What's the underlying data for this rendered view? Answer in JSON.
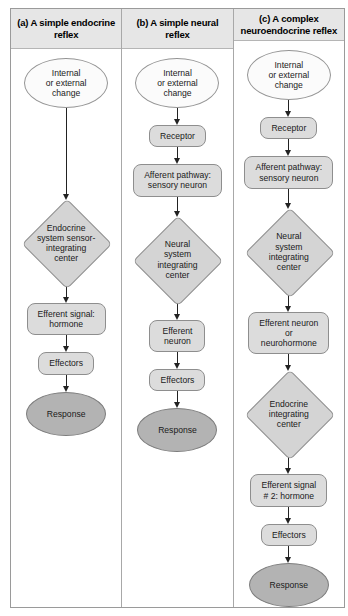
{
  "figure": {
    "background": "#ffffff",
    "border_color": "#9a9a9a",
    "header_background": "#e6e6e6",
    "node_fill": "#dcdcdc",
    "diamond_fill": "#d4d4d4",
    "response_fill": "#b3b3b3",
    "start_fill": "#fbfbfb",
    "arrow_color": "#222222"
  },
  "columns": [
    {
      "id": "a",
      "header": "(a) A simple endocrine reflex",
      "nodes": [
        {
          "shape": "ellipse",
          "name": "stimulus",
          "label": "Internal\nor external\nchange"
        },
        {
          "shape": "arrow",
          "name": "arrow-long",
          "length": "long"
        },
        {
          "shape": "diamond",
          "name": "integrating-center",
          "label": "Endocrine\nsystem sensor-\nintegrating\ncenter"
        },
        {
          "shape": "arrow",
          "name": "arrow",
          "length": "short"
        },
        {
          "shape": "rrect",
          "name": "efferent-signal",
          "label": "Efferent signal:\nhormone"
        },
        {
          "shape": "arrow",
          "name": "arrow",
          "length": "short"
        },
        {
          "shape": "rrect",
          "name": "effectors",
          "label": "Effectors"
        },
        {
          "shape": "arrow",
          "name": "arrow",
          "length": "short"
        },
        {
          "shape": "ellipse-dark",
          "name": "response",
          "label": "Response"
        }
      ]
    },
    {
      "id": "b",
      "header": "(b) A simple neural reflex",
      "nodes": [
        {
          "shape": "ellipse",
          "name": "stimulus",
          "label": "Internal\nor external\nchange"
        },
        {
          "shape": "arrow",
          "name": "arrow",
          "length": "short"
        },
        {
          "shape": "rrect",
          "name": "receptor",
          "label": "Receptor"
        },
        {
          "shape": "arrow",
          "name": "arrow",
          "length": "short"
        },
        {
          "shape": "rrect",
          "name": "afferent-pathway",
          "label": "Afferent pathway:\nsensory neuron"
        },
        {
          "shape": "arrow",
          "name": "arrow",
          "length": "mid"
        },
        {
          "shape": "diamond",
          "name": "integrating-center",
          "label": "Neural\nsystem\nintegrating\ncenter"
        },
        {
          "shape": "arrow",
          "name": "arrow",
          "length": "short"
        },
        {
          "shape": "rrect",
          "name": "efferent-neuron",
          "label": "Efferent\nneuron"
        },
        {
          "shape": "arrow",
          "name": "arrow",
          "length": "short"
        },
        {
          "shape": "rrect",
          "name": "effectors",
          "label": "Effectors"
        },
        {
          "shape": "arrow",
          "name": "arrow",
          "length": "short"
        },
        {
          "shape": "ellipse-dark",
          "name": "response",
          "label": "Response"
        }
      ]
    },
    {
      "id": "c",
      "header": "(c) A complex neuroendocrine reflex",
      "nodes": [
        {
          "shape": "ellipse",
          "name": "stimulus",
          "label": "Internal\nor external\nchange"
        },
        {
          "shape": "arrow",
          "name": "arrow",
          "length": "short"
        },
        {
          "shape": "rrect",
          "name": "receptor",
          "label": "Receptor"
        },
        {
          "shape": "arrow",
          "name": "arrow",
          "length": "short"
        },
        {
          "shape": "rrect",
          "name": "afferent-pathway",
          "label": "Afferent pathway:\nsensory neuron"
        },
        {
          "shape": "arrow",
          "name": "arrow",
          "length": "mid"
        },
        {
          "shape": "diamond",
          "name": "neural-integrating-center",
          "label": "Neural\nsystem\nintegrating\ncenter"
        },
        {
          "shape": "arrow",
          "name": "arrow",
          "length": "short"
        },
        {
          "shape": "rrect",
          "name": "efferent-neuron",
          "label": "Efferent neuron\nor\nneurohormone"
        },
        {
          "shape": "arrow",
          "name": "arrow",
          "length": "short"
        },
        {
          "shape": "diamond",
          "name": "endocrine-integrating-center",
          "label": "Endocrine\nintegrating\ncenter"
        },
        {
          "shape": "arrow",
          "name": "arrow",
          "length": "short"
        },
        {
          "shape": "rrect",
          "name": "efferent-signal-2",
          "label": "Efferent signal\n# 2: hormone"
        },
        {
          "shape": "arrow",
          "name": "arrow",
          "length": "short"
        },
        {
          "shape": "rrect",
          "name": "effectors",
          "label": "Effectors"
        },
        {
          "shape": "arrow",
          "name": "arrow",
          "length": "short"
        },
        {
          "shape": "ellipse-dark",
          "name": "response",
          "label": "Response"
        }
      ]
    }
  ]
}
